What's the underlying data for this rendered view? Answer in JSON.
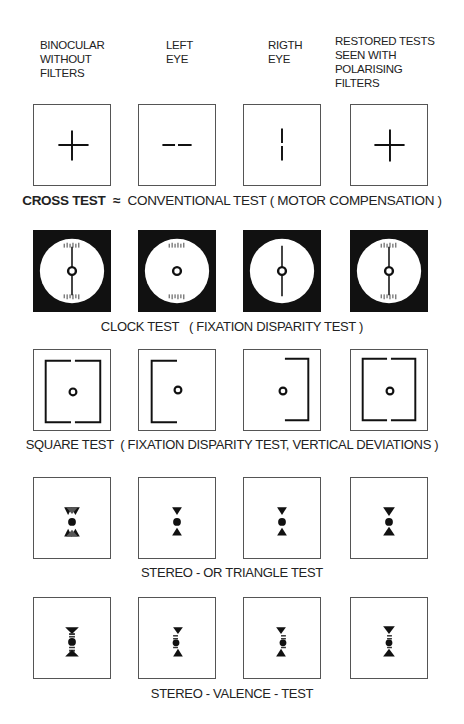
{
  "column_headers": [
    {
      "id": "binocular",
      "text": "BINOCULAR\nWITHOUT\nFILTERS"
    },
    {
      "id": "left-eye",
      "text": "LEFT\nEYE"
    },
    {
      "id": "right-eye",
      "text": "RIGTH\nEYE"
    },
    {
      "id": "restored",
      "text": "RESTORED TESTS\nSEEN WITH\nPOLARISING\nFILTERS"
    }
  ],
  "rows": [
    {
      "id": "cross",
      "caption_bold": "CROSS TEST",
      "caption_symbol": "≈",
      "caption_rest": "CONVENTIONAL TEST ( MOTOR COMPENSATION )",
      "cells": [
        "cross-displaced",
        "horizontal-dashes",
        "vertical-line",
        "cross"
      ]
    },
    {
      "id": "clock",
      "caption_rest": "CLOCK TEST   ( FIXATION DISPARITY TEST )",
      "cells": [
        "clock-full",
        "clock-scales-only",
        "clock-pointer-only",
        "clock-full"
      ]
    },
    {
      "id": "square",
      "caption_rest": "SQUARE TEST  ( FIXATION DISPARITY TEST, VERTICAL DEVIATIONS )",
      "cells": [
        "square-full-offset",
        "square-left-bracket",
        "square-right-bracket",
        "square-full"
      ]
    },
    {
      "id": "triangle",
      "caption_rest": "STEREO - OR TRIANGLE TEST",
      "cells": [
        "triangles-doubled",
        "triangles",
        "triangles",
        "triangles"
      ]
    },
    {
      "id": "valence",
      "caption_rest": "STEREO - VALENCE - TEST",
      "cells": [
        "valence-doubled",
        "valence",
        "valence",
        "valence"
      ]
    }
  ],
  "colors": {
    "ink": "#111111",
    "paper": "#ffffff",
    "border": "#555555"
  }
}
